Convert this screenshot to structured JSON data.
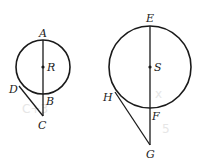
{
  "diagram": {
    "figures": [
      {
        "name": "circle-R",
        "center_label": "R",
        "points": {
          "top": "A",
          "bottom": "B",
          "tangent_point": "D",
          "external": "C"
        },
        "geometry": {
          "cx": 43,
          "cy": 67,
          "r": 27,
          "C": [
            43,
            116
          ],
          "D": [
            19,
            86
          ]
        }
      },
      {
        "name": "circle-S",
        "center_label": "S",
        "points": {
          "top": "E",
          "bottom": "F",
          "tangent_point": "H",
          "external": "G"
        },
        "geometry": {
          "cx": 150,
          "cy": 67,
          "r": 41,
          "G": [
            150,
            145
          ],
          "H": [
            115,
            92
          ]
        }
      }
    ],
    "labels": {
      "A": "A",
      "R": "R",
      "D": "D",
      "B": "B",
      "C": "C",
      "E": "E",
      "S": "S",
      "H": "H",
      "F": "F",
      "G": "G"
    },
    "faint_marks": [
      "C+3",
      "x",
      "5"
    ],
    "colors": {
      "ink": "#1a1a1a",
      "background": "#ffffff",
      "faint": "#e6e6e6"
    }
  }
}
